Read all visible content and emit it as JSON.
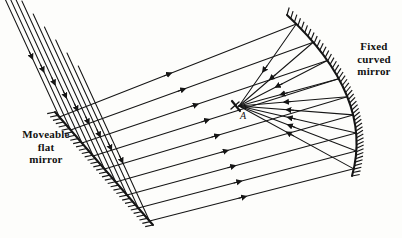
{
  "figure": {
    "type": "optics-ray-diagram",
    "background_color": "#fdfdfb",
    "stroke_color": "#151515",
    "width": 402,
    "height": 238
  },
  "labels": {
    "flat_mirror": "Moveable\nflat\nmirror",
    "curved_mirror": "Fixed\ncurved\nmirror",
    "focal_point": "A"
  },
  "chart_data": {
    "type": "diagram",
    "title": "",
    "elements": {
      "flat_mirror": {
        "name": "Moveable flat mirror",
        "x1": 55,
        "y1": 112,
        "x2": 153,
        "y2": 225,
        "hatch_side": "left",
        "hatch_count": 34,
        "hatch_length": 7
      },
      "curved_mirror": {
        "name": "Fixed curved mirror",
        "x1": 287,
        "y1": 15,
        "x2": 352,
        "y2": 176,
        "bulge_x": 347,
        "bulge_y": 96,
        "hatch_side": "outside",
        "hatch_count": 46,
        "hatch_length": 7
      },
      "focal_point": {
        "name": "A",
        "x": 237,
        "y": 106
      }
    },
    "ray_families": [
      {
        "name": "incoming-parallel-rays",
        "direction": "down-right",
        "arrow": "mid-forward",
        "count": 9,
        "description": "Parallel beam entering from upper left, striking the moveable flat mirror"
      },
      {
        "name": "flat-mirror-reflected-rays",
        "direction": "right-slightly-down",
        "arrow": "mid-forward",
        "count": 9,
        "description": "Rays reflected off the flat mirror travelling right toward the fixed curved mirror"
      },
      {
        "name": "curved-mirror-converging-rays",
        "direction": "toward-focal-point",
        "arrow": "mid-toward-A",
        "count": 9,
        "description": "Rays reflected off the curved mirror converging on focal point A"
      }
    ]
  }
}
